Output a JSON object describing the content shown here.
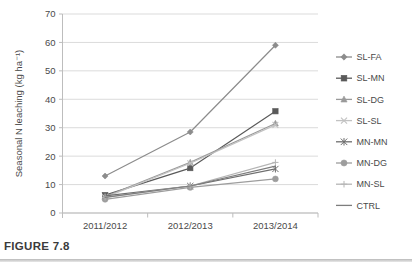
{
  "figure": {
    "caption": "FIGURE 7.8"
  },
  "chart_data": {
    "type": "line",
    "title": "",
    "xlabel": "",
    "ylabel": "Seasonal N leaching (kg ha⁻¹)",
    "categories": [
      "2011/2012",
      "2012/2013",
      "2013/2014"
    ],
    "ylim": [
      0,
      70
    ],
    "ytick_step": 10,
    "yticks": [
      "0",
      "10",
      "20",
      "30",
      "40",
      "50",
      "60",
      "70"
    ],
    "grid": "horizontal",
    "legend_position": "right",
    "series": [
      {
        "name": "SL-FA",
        "marker": "diamond",
        "color": "#8c8c8c",
        "values": [
          13,
          28.5,
          59
        ]
      },
      {
        "name": "SL-MN",
        "marker": "square",
        "color": "#5a5a5a",
        "values": [
          6.3,
          15.8,
          35.8
        ]
      },
      {
        "name": "SL-DG",
        "marker": "triangle",
        "color": "#9a9a9a",
        "values": [
          5.8,
          17.8,
          31.5
        ]
      },
      {
        "name": "SL-SL",
        "marker": "x",
        "color": "#c2c2c2",
        "values": [
          5.5,
          17.5,
          31.0
        ]
      },
      {
        "name": "MN-MN",
        "marker": "asterisk",
        "color": "#6e6e6e",
        "values": [
          6.0,
          9.5,
          15.5
        ]
      },
      {
        "name": "MN-DG",
        "marker": "circle",
        "color": "#9d9d9d",
        "values": [
          4.8,
          9.0,
          12.0
        ]
      },
      {
        "name": "MN-SL",
        "marker": "plus",
        "color": "#b5b5b5",
        "values": [
          5.5,
          9.5,
          17.8
        ]
      },
      {
        "name": "CTRL",
        "marker": "line",
        "color": "#7d7d7d",
        "values": [
          5.5,
          9.5,
          16.5
        ]
      }
    ]
  },
  "legend": {
    "items": [
      {
        "label": "SL-FA"
      },
      {
        "label": "SL-MN"
      },
      {
        "label": "SL-DG"
      },
      {
        "label": "SL-SL"
      },
      {
        "label": "MN-MN"
      },
      {
        "label": "MN-DG"
      },
      {
        "label": "MN-SL"
      },
      {
        "label": "CTRL"
      }
    ]
  }
}
